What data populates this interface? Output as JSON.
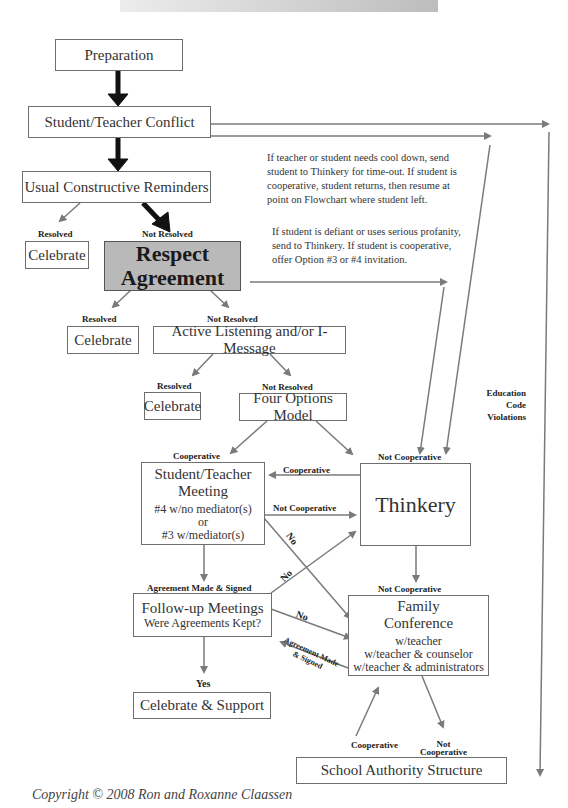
{
  "boxes": {
    "preparation": "Preparation",
    "conflict": "Student/Teacher Conflict",
    "reminders": "Usual Constructive Reminders",
    "celebrate": "Celebrate",
    "respect_line1": "Respect",
    "respect_line2": "Agreement",
    "active_listening": "Active Listening and/or I-Message",
    "four_options": "Four Options Model",
    "meeting_title1": "Student/Teacher",
    "meeting_title2": "Meeting",
    "meeting_sub1": "#4 w/no mediator(s)",
    "meeting_sub2": "or",
    "meeting_sub3": "#3 w/mediator(s)",
    "thinkery": "Thinkery",
    "followup_title": "Follow-up Meetings",
    "followup_sub": "Were Agreements Kept?",
    "family_title1": "Family",
    "family_title2": "Conference",
    "family_sub1": "w/teacher",
    "family_sub2": "w/teacher & counselor",
    "family_sub3": "w/teacher & administrators",
    "celebrate_support": "Celebrate & Support",
    "school_authority": "School Authority Structure"
  },
  "labels": {
    "resolved": "Resolved",
    "not_resolved": "Not Resolved",
    "cooperative": "Cooperative",
    "not_cooperative": "Not Cooperative",
    "not": "Not",
    "no": "No",
    "yes": "Yes",
    "agreement_made_signed": "Agreement Made & Signed",
    "agreement_made": "Agreement Made",
    "and_signed": "& Signed",
    "edu1": "Education",
    "edu2": "Code",
    "edu3": "Violations"
  },
  "notes": {
    "cool_down": "If teacher or student needs cool down, send student to Thinkery for time-out. If student is cooperative, student returns, then resume at point on Flowchart where student left.",
    "defiant": "If student is defiant or uses serious profanity, send to Thinkery.  If student is cooperative, offer Option #3 or #4 invitation."
  },
  "copyright": "Copyright © 2008 Ron and Roxanne Claassen",
  "colors": {
    "respect_fill": "#b9b9b9",
    "arrow_gray": "#7a7a7a",
    "arrow_black": "#111111"
  }
}
